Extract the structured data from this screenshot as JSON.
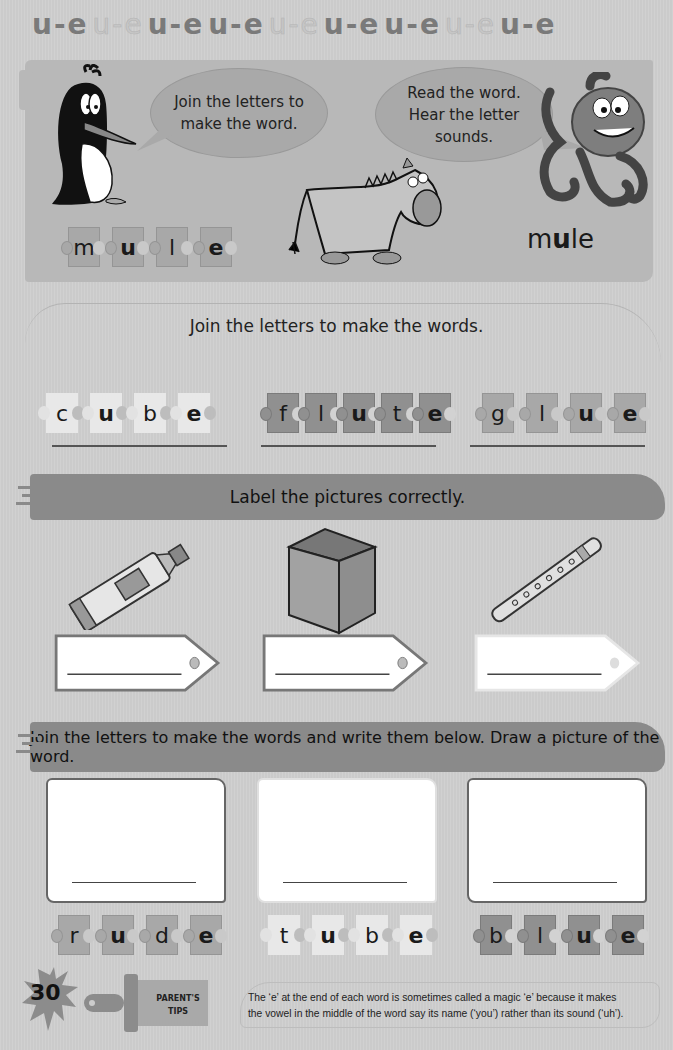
{
  "header_pattern": [
    {
      "text": "u-e",
      "style": "dark"
    },
    {
      "text": "u-e",
      "style": "light"
    },
    {
      "text": "u-e",
      "style": "dark"
    },
    {
      "text": "u-e",
      "style": "dark"
    },
    {
      "text": "u-e",
      "style": "light"
    },
    {
      "text": "u-e",
      "style": "dark"
    },
    {
      "text": "u-e",
      "style": "dark"
    },
    {
      "text": "u-e",
      "style": "light"
    },
    {
      "text": "u-e",
      "style": "dark"
    }
  ],
  "intro": {
    "penguin_bubble": [
      "Join the letters to",
      "make the word."
    ],
    "octopus_bubble": [
      "Read the word.",
      "Hear the letter",
      "sounds."
    ],
    "example_letters": [
      "m",
      "u",
      "l",
      "e"
    ],
    "example_word": {
      "pre": "m",
      "bold": "u",
      "post": "le"
    },
    "illustrations": [
      "penguin",
      "mule",
      "octopus"
    ]
  },
  "section_join": {
    "title": "Join the letters to make the words.",
    "words": [
      {
        "letters": [
          "c",
          "u",
          "b",
          "e"
        ],
        "color": "light"
      },
      {
        "letters": [
          "f",
          "l",
          "u",
          "t",
          "e"
        ],
        "color": "dark"
      },
      {
        "letters": [
          "g",
          "l",
          "u",
          "e"
        ],
        "color": "gray"
      }
    ]
  },
  "section_label": {
    "title": "Label the pictures correctly.",
    "pictures": [
      "glue-tube",
      "cube",
      "flute"
    ]
  },
  "section_draw": {
    "title": "Join the letters to make the words and write them below. Draw a picture of the word.",
    "words": [
      {
        "letters": [
          "r",
          "u",
          "d",
          "e"
        ],
        "color": "gray"
      },
      {
        "letters": [
          "t",
          "u",
          "b",
          "e"
        ],
        "color": "light"
      },
      {
        "letters": [
          "b",
          "l",
          "u",
          "e"
        ],
        "color": "dark"
      }
    ]
  },
  "footer": {
    "page_number": "30",
    "tips_label_line1": "PARENT'S",
    "tips_label_line2": "TIPS",
    "tips_line1": "The ‘e’ at the end of each word is sometimes called a magic ‘e’ because it makes",
    "tips_line2": "the vowel in the middle of the word say its name (‘you’) rather than its sound (‘uh’)."
  },
  "colors": {
    "background": "#cfcfcf",
    "panel": "#b8b8b8",
    "banner": "#8a8a8a",
    "piece_light": "#e8e8e8",
    "piece_gray": "#a8a8a8",
    "piece_dark": "#909090"
  }
}
